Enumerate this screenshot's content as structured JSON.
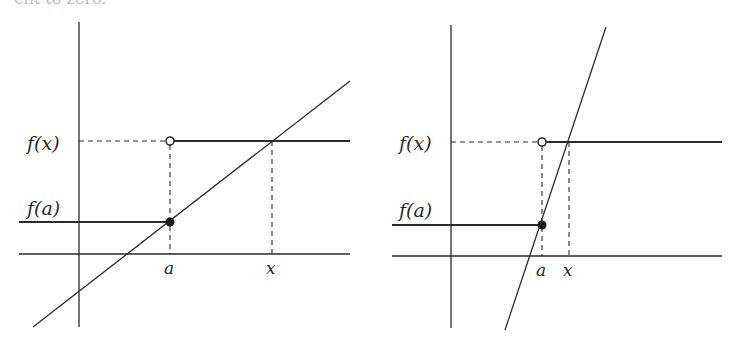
{
  "top_text": "ent to zero.",
  "diagrams": [
    {
      "name": "gentle-slope",
      "labels": {
        "fx": "f(x)",
        "fa": "f(a)",
        "a": "a",
        "x": "x"
      }
    },
    {
      "name": "steep-slope",
      "labels": {
        "fx": "f(x)",
        "fa": "f(a)",
        "a": "a",
        "x": "x"
      }
    }
  ],
  "colors": {
    "line": "#2a2a2a",
    "background": "#ffffff"
  }
}
